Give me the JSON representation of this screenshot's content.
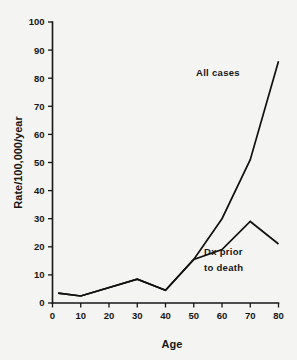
{
  "chart_data": {
    "type": "line",
    "title": "",
    "xlabel": "Age",
    "ylabel": "Rate/100,000/year",
    "xlim": [
      0,
      80
    ],
    "ylim": [
      0,
      100
    ],
    "grid": false,
    "legend_position": "inline-annotation",
    "x_ticks": [
      0,
      10,
      20,
      30,
      40,
      50,
      60,
      70,
      80
    ],
    "x_tick_labels": [
      "0",
      "10",
      "20",
      "30",
      "40",
      "50",
      "60",
      "70",
      "80"
    ],
    "y_ticks": [
      0,
      10,
      20,
      30,
      40,
      50,
      60,
      70,
      80,
      90,
      100
    ],
    "y_tick_labels": [
      "0",
      "10",
      "20",
      "30",
      "40",
      "50",
      "60",
      "70",
      "80",
      "90",
      "100"
    ],
    "series": [
      {
        "name": "All cases",
        "annotation": "All cases",
        "x": [
          2,
          10,
          30,
          40,
          50,
          60,
          70,
          80
        ],
        "values": [
          3.5,
          2.5,
          8.5,
          4.5,
          15.5,
          30.0,
          51.0,
          86.0
        ]
      },
      {
        "name": "Dx prior to death",
        "annotation_line1": "Dx prior",
        "annotation_line2": "to death",
        "x": [
          2,
          10,
          30,
          40,
          50,
          60,
          70,
          80
        ],
        "values": [
          3.5,
          2.5,
          8.5,
          4.5,
          15.5,
          19.0,
          29.0,
          21.0
        ]
      }
    ]
  },
  "colors": {
    "background": "#f4f4f2",
    "ink": "#161616",
    "line": "#111111"
  }
}
